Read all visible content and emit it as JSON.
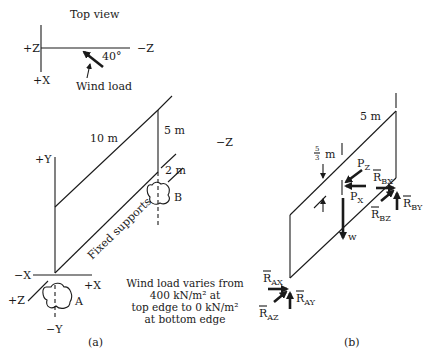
{
  "top_view": {
    "title": "Top view",
    "axis_plus_z": "+Z",
    "axis_minus_z": "−Z",
    "axis_plus_x": "+X",
    "angle": "40°",
    "wind_label": "Wind load"
  },
  "figure_a": {
    "caption": "(a)",
    "dim_length": "10 m",
    "dim_height": "5 m",
    "dim_offset": "2 m",
    "axis_plus_y": "+Y",
    "axis_minus_y": "−Y",
    "axis_plus_x": "+X",
    "axis_minus_x": "−X",
    "axis_plus_z": "+Z",
    "axis_minus_z": "−Z",
    "support_a": "A",
    "support_b": "B",
    "supports_label": "Fixed supports",
    "note_lines": [
      "Wind load varies from",
      "400 kN/m² at",
      "top edge to 0 kN/m²",
      "at bottom edge"
    ]
  },
  "figure_b": {
    "caption": "(b)",
    "dim_height": "5 m",
    "dim_fraction_num": "5",
    "dim_fraction_den": "3",
    "dim_fraction_unit": "m",
    "force_pz": "P",
    "force_pz_sub": "Z",
    "force_px": "P",
    "force_px_sub": "X",
    "weight": "w",
    "reactions": {
      "rbx": {
        "main": "R",
        "sub": "BX"
      },
      "rby": {
        "main": "R",
        "sub": "BY"
      },
      "rbz": {
        "main": "R",
        "sub": "BZ"
      },
      "rax": {
        "main": "R",
        "sub": "AX"
      },
      "ray": {
        "main": "R",
        "sub": "AY"
      },
      "raz": {
        "main": "R",
        "sub": "AZ"
      }
    }
  }
}
